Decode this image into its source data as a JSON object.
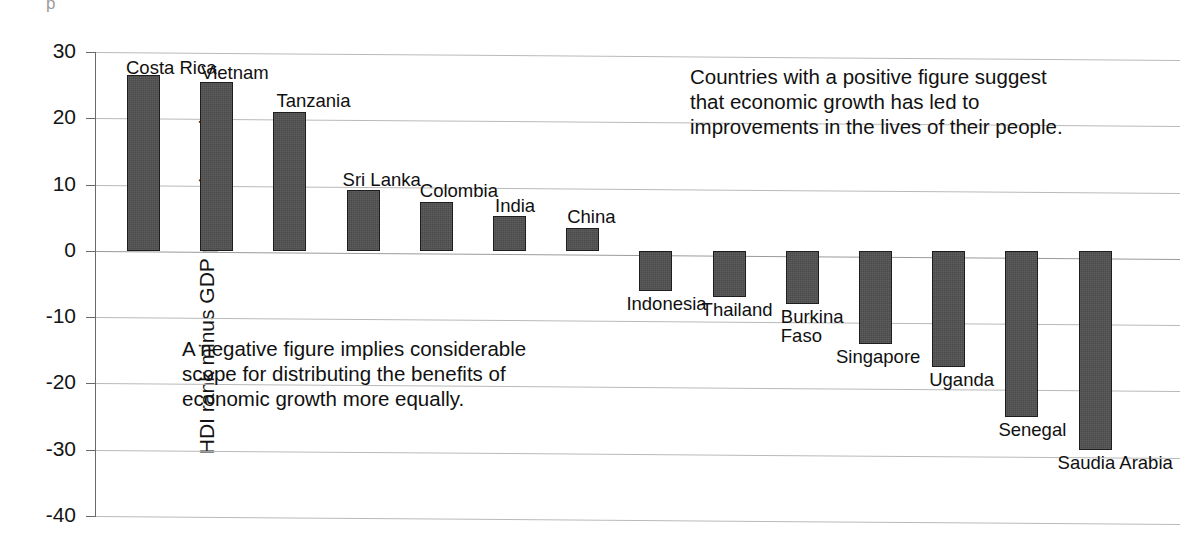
{
  "artifact": {
    "glyph": "p"
  },
  "chart_data": {
    "type": "bar",
    "title": "",
    "xlabel": "",
    "ylabel": "HDI rank minus GDP per capita rank",
    "ylim": [
      -40,
      30
    ],
    "ytick_step": 10,
    "grid": true,
    "legend": "none",
    "orientation": "vertical",
    "bar_color": "#4a4a4a",
    "bar_edge_color": "#1d1d1d",
    "categories": [
      "Costa Rica",
      "Vietnam",
      "Tanzania",
      "Sri Lanka",
      "Colombia",
      "India",
      "China",
      "Indonesia",
      "Thailand",
      "Burkina Faso",
      "Singapore",
      "Uganda",
      "Senegal",
      "Saudia Arabia"
    ],
    "values": [
      26.5,
      25.5,
      21,
      9.2,
      7.3,
      5.2,
      3.5,
      -6,
      -7,
      -8,
      -14,
      -17.5,
      -25,
      -30
    ],
    "yticks": [
      30,
      20,
      10,
      0,
      -10,
      -20,
      -30,
      -40
    ],
    "ytick_labels": [
      "30",
      "20",
      "10",
      "0",
      "-10",
      "-20",
      "-30",
      "-40"
    ],
    "annotations": [
      {
        "name": "positive",
        "text": "Countries with a positive figure suggest\nthat economic growth has led to\nimprovements in the lives of their people."
      },
      {
        "name": "negative",
        "text": "A negative figure implies considerable\nscope for distributing the benefits of\neconomic growth more equally."
      }
    ],
    "bar_labels": [
      {
        "label": "Costa Rica",
        "lines": [
          "Costa Rica"
        ]
      },
      {
        "label": "Vietnam",
        "lines": [
          "Vietnam"
        ]
      },
      {
        "label": "Tanzania",
        "lines": [
          "Tanzania"
        ]
      },
      {
        "label": "Sri Lanka",
        "lines": [
          "Sri Lanka"
        ]
      },
      {
        "label": "Colombia",
        "lines": [
          "Colombia"
        ]
      },
      {
        "label": "India",
        "lines": [
          "India"
        ]
      },
      {
        "label": "China",
        "lines": [
          "China"
        ]
      },
      {
        "label": "Indonesia",
        "lines": [
          "Indonesia"
        ]
      },
      {
        "label": "Thailand",
        "lines": [
          "Thailand"
        ]
      },
      {
        "label": "Burkina Faso",
        "lines": [
          "Burkina",
          "Faso"
        ]
      },
      {
        "label": "Singapore",
        "lines": [
          "Singapore"
        ]
      },
      {
        "label": "Uganda",
        "lines": [
          "Uganda"
        ]
      },
      {
        "label": "Senegal",
        "lines": [
          "Senegal"
        ]
      },
      {
        "label": "Saudia Arabia",
        "lines": [
          "Saudia Arabia"
        ]
      }
    ]
  }
}
